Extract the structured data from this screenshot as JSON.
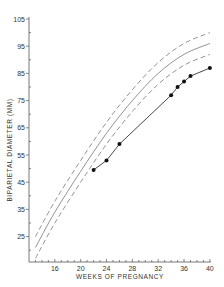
{
  "chart_data": {
    "type": "line",
    "title": "",
    "xlabel": "WEEKS OF PREGNANCY",
    "ylabel": "BIPARIETAL DIAMETER (MM)",
    "xlim": [
      12,
      40
    ],
    "ylim": [
      15,
      105
    ],
    "x_ticks": [
      16,
      20,
      24,
      28,
      32,
      36,
      40
    ],
    "y_ticks": [
      25,
      35,
      45,
      55,
      65,
      75,
      85,
      95,
      105
    ],
    "grid": false,
    "legend": null,
    "series": [
      {
        "name": "upper limit (dashed)",
        "style": "dashed",
        "x": [
          13,
          16,
          20,
          24,
          28,
          32,
          36,
          40
        ],
        "values": [
          25,
          38,
          53,
          67,
          79,
          89,
          96,
          100
        ]
      },
      {
        "name": "mean (solid)",
        "style": "solid",
        "x": [
          13,
          16,
          20,
          24,
          28,
          32,
          36,
          40
        ],
        "values": [
          21,
          34,
          49,
          63,
          75,
          85,
          92,
          96
        ]
      },
      {
        "name": "lower limit (dashed)",
        "style": "dashed",
        "x": [
          13,
          16,
          20,
          24,
          28,
          32,
          36,
          40
        ],
        "values": [
          17,
          30,
          45,
          59,
          71,
          81,
          88,
          92
        ]
      },
      {
        "name": "patient measurements",
        "style": "solid-markers",
        "x": [
          22,
          24,
          26,
          34,
          35,
          36,
          37,
          40
        ],
        "values": [
          49.5,
          53,
          59,
          77,
          80,
          82,
          84,
          87
        ]
      }
    ]
  },
  "axes": {
    "x_label": "WEEKS OF PREGNANCY",
    "y_label": "BIPARIETAL DIAMETER (MM)",
    "x_tick_labels": [
      "16",
      "20",
      "24",
      "28",
      "32",
      "36",
      "40"
    ],
    "y_tick_labels": [
      "105",
      "95",
      "85",
      "75",
      "65",
      "55",
      "45",
      "35",
      "25"
    ]
  }
}
